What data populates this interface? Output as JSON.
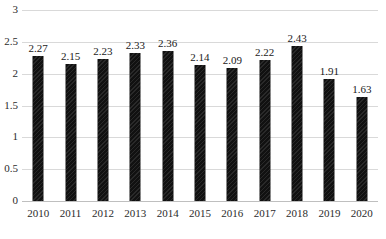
{
  "chart_data": {
    "type": "bar",
    "title": "",
    "subtitle": "",
    "xlabel": "",
    "ylabel": "",
    "categories": [
      "2010",
      "2011",
      "2012",
      "2013",
      "2014",
      "2015",
      "2016",
      "2017",
      "2018",
      "2019",
      "2020"
    ],
    "values": [
      2.27,
      2.15,
      2.23,
      2.33,
      2.36,
      2.14,
      2.09,
      2.22,
      2.43,
      1.91,
      1.63
    ],
    "data_labels": [
      "2.27",
      "2.15",
      "2.23",
      "2.33",
      "2.36",
      "2.14",
      "2.09",
      "2.22",
      "2.43",
      "1.91",
      "1.63"
    ],
    "ylim": [
      0,
      3
    ],
    "ytick_values": [
      0,
      0.5,
      1,
      1.5,
      2,
      2.5,
      3
    ],
    "ytick_labels": [
      "0",
      "0.5",
      "1",
      "1.5",
      "2",
      "2.5",
      "3"
    ],
    "grid": true,
    "grid_orientation": "horizontal",
    "legend": false,
    "legend_position": "none",
    "bar_color": "#111111",
    "gridline_color": "#d9d9d9",
    "axis_color": "#bfbfbf",
    "background_color": "#ffffff",
    "label_color": "#2b2b2b"
  }
}
